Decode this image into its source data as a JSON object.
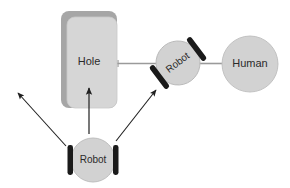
{
  "diagram": {
    "canvas": {
      "width": 290,
      "height": 188,
      "background": "#ffffff"
    },
    "palette": {
      "shape_fill": "#d6d6d6",
      "shape_shadow": "#a6a6a6",
      "circle_fill": "#d2d2d2",
      "circle_stroke": "#b5b5b5",
      "wheel_color": "#1a1a1a",
      "connector": "#9a9a9a",
      "arrow": "#1f1f1f",
      "text": "#2b2b2b"
    },
    "nodes": [
      {
        "id": "hole",
        "label": "Hole",
        "type": "rounded-rectangle",
        "x": 61,
        "y": 11,
        "width": 54,
        "height": 97,
        "label_x": 89,
        "label_y": 62,
        "font_size": 11
      },
      {
        "id": "robot-middle",
        "label": "Robot",
        "type": "robot",
        "cx": 178,
        "cy": 63,
        "r": 22,
        "rotation": -37,
        "font_size": 10
      },
      {
        "id": "human",
        "label": "Human",
        "type": "circle",
        "cx": 250,
        "cy": 64,
        "r": 28,
        "font_size": 11
      },
      {
        "id": "robot-bottom",
        "label": "Robot",
        "type": "robot",
        "cx": 93,
        "cy": 160,
        "r": 22,
        "rotation": 0,
        "font_size": 10
      }
    ],
    "connectors": [
      {
        "id": "hole-to-robot",
        "from": "hole",
        "to": "robot-middle",
        "style": "solid-line"
      },
      {
        "id": "robot-to-human",
        "from": "robot-middle",
        "to": "human",
        "style": "solid-line"
      }
    ],
    "arrows": [
      {
        "id": "arrow-upper-left",
        "from_x": 66,
        "from_y": 146,
        "to_x": 17,
        "to_y": 92,
        "label": ""
      },
      {
        "id": "arrow-up-to-hole",
        "from_x": 89,
        "from_y": 134,
        "to_x": 89,
        "to_y": 86,
        "label": ""
      },
      {
        "id": "arrow-to-robot",
        "from_x": 116,
        "from_y": 141,
        "to_x": 157,
        "to_y": 89,
        "label": ""
      }
    ]
  }
}
